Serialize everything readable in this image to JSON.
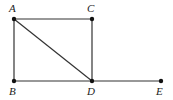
{
  "diagram": {
    "points": [
      {
        "id": "A",
        "label": "A",
        "x": 14,
        "y": 19,
        "lx": 9,
        "ly": 3
      },
      {
        "id": "C",
        "label": "C",
        "x": 92,
        "y": 19,
        "lx": 87,
        "ly": 3
      },
      {
        "id": "B",
        "label": "B",
        "x": 14,
        "y": 81,
        "lx": 9,
        "ly": 86
      },
      {
        "id": "D",
        "label": "D",
        "x": 92,
        "y": 81,
        "lx": 87,
        "ly": 86
      },
      {
        "id": "E",
        "label": "E",
        "x": 161,
        "y": 81,
        "lx": 156,
        "ly": 86
      }
    ],
    "segments": [
      [
        "A",
        "C"
      ],
      [
        "A",
        "B"
      ],
      [
        "C",
        "D"
      ],
      [
        "B",
        "D"
      ],
      [
        "D",
        "E"
      ],
      [
        "A",
        "D"
      ]
    ],
    "line_color": "#333333"
  }
}
